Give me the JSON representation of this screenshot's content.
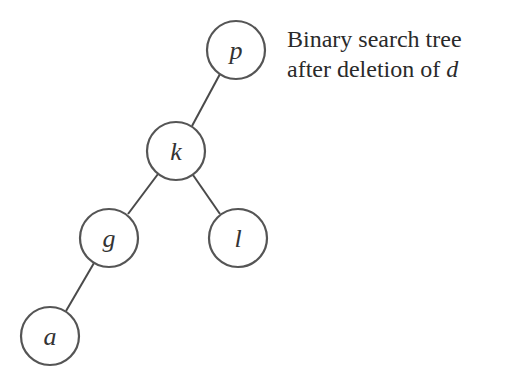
{
  "caption": {
    "line1": "Binary search tree",
    "line2_prefix": "after deletion of ",
    "line2_var": "d"
  },
  "tree": {
    "nodes": [
      {
        "id": "p",
        "label": "p",
        "cx": 236,
        "cy": 50,
        "r": 29
      },
      {
        "id": "k",
        "label": "k",
        "cx": 176,
        "cy": 151,
        "r": 29
      },
      {
        "id": "g",
        "label": "g",
        "cx": 109,
        "cy": 238,
        "r": 29
      },
      {
        "id": "l",
        "label": "l",
        "cx": 238,
        "cy": 238,
        "r": 29
      },
      {
        "id": "a",
        "label": "a",
        "cx": 50,
        "cy": 336,
        "r": 29
      }
    ],
    "edges": [
      {
        "from": "p",
        "to": "k"
      },
      {
        "from": "k",
        "to": "g"
      },
      {
        "from": "k",
        "to": "l"
      },
      {
        "from": "g",
        "to": "a"
      }
    ]
  }
}
